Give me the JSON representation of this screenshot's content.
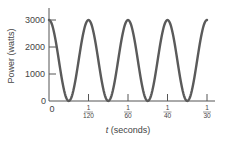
{
  "chart_data": {
    "type": "line",
    "title": "",
    "xlabel": "t (seconds)",
    "xlabel_var": "t",
    "xlabel_unit": "(seconds)",
    "ylabel": "Power (watts)",
    "ylim": [
      0,
      3000
    ],
    "xlim": [
      0,
      0.0333
    ],
    "grid": false,
    "legend": null,
    "y_ticks": [
      {
        "value": 0,
        "label": "0"
      },
      {
        "value": 1000,
        "label": "1000"
      },
      {
        "value": 2000,
        "label": "2000"
      },
      {
        "value": 3000,
        "label": "3000"
      }
    ],
    "x_ticks": [
      {
        "value": 0,
        "label": "0",
        "num": "",
        "den": ""
      },
      {
        "value": 0.008333,
        "label": "1/120",
        "num": "1",
        "den": "120"
      },
      {
        "value": 0.016667,
        "label": "1/60",
        "num": "1",
        "den": "60"
      },
      {
        "value": 0.025,
        "label": "1/40",
        "num": "1",
        "den": "40"
      },
      {
        "value": 0.033333,
        "label": "1/30",
        "num": "1",
        "den": "30"
      }
    ],
    "series": [
      {
        "name": "Power",
        "formula": "P(t) = 3000 cos^2(2*pi*60*t)",
        "color": "#555555",
        "x": [
          0,
          0.004167,
          0.008333,
          0.0125,
          0.016667,
          0.020833,
          0.025,
          0.029167,
          0.033333
        ],
        "values": [
          3000,
          0,
          3000,
          0,
          3000,
          0,
          3000,
          0,
          3000
        ]
      }
    ]
  },
  "labels": {
    "ylabel": "Power (watts)",
    "xlabel_var": "t",
    "xlabel_unit": " (seconds)",
    "origin_x": "0",
    "origin_y": "0",
    "y1000": "1000",
    "y2000": "2000",
    "y3000": "3000",
    "x1_num": "1",
    "x1_den": "120",
    "x2_num": "1",
    "x2_den": "60",
    "x3_num": "1",
    "x3_den": "40",
    "x4_num": "1",
    "x4_den": "30"
  }
}
